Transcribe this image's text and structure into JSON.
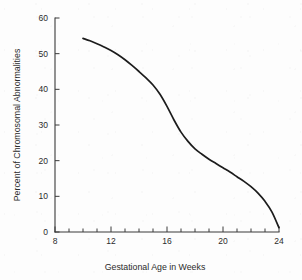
{
  "chart_data": {
    "type": "line",
    "title": "",
    "xlabel": "Gestational Age in Weeks",
    "ylabel": "Percent of Chromosomal Abnormalities",
    "xlim": [
      8,
      24
    ],
    "ylim": [
      0,
      60
    ],
    "grid": false,
    "legend": "none",
    "x_tick_labels": [
      "8",
      "12",
      "16",
      "20",
      "24"
    ],
    "x_major_ticks": [
      8,
      12,
      16,
      20,
      24
    ],
    "x_minor_ticks": [
      9,
      10,
      11,
      13,
      14,
      15,
      17,
      18,
      19,
      21,
      22,
      23
    ],
    "y_tick_labels": [
      "0",
      "10",
      "20",
      "30",
      "40",
      "50",
      "60"
    ],
    "y_major_ticks": [
      0,
      10,
      20,
      30,
      40,
      50,
      60
    ],
    "series": [
      {
        "name": "Percent of Chromosomal Abnormalities",
        "color": "#1c1c1c",
        "x": [
          10.0,
          10.5,
          11.0,
          11.5,
          12.0,
          12.5,
          13.0,
          13.5,
          14.0,
          14.5,
          15.0,
          15.5,
          16.0,
          16.5,
          17.0,
          17.5,
          18.0,
          18.5,
          19.0,
          19.5,
          20.0,
          20.5,
          21.0,
          21.5,
          22.0,
          22.5,
          23.0,
          23.5,
          24.0
        ],
        "y": [
          54.3,
          53.6,
          52.8,
          51.9,
          50.9,
          49.7,
          48.3,
          46.7,
          45.0,
          43.2,
          41.2,
          38.6,
          35.2,
          31.4,
          28.0,
          25.4,
          23.3,
          21.8,
          20.4,
          19.2,
          18.0,
          16.8,
          15.5,
          14.2,
          12.7,
          10.9,
          8.6,
          5.6,
          1.2
        ]
      }
    ]
  },
  "axis": {
    "y_label": "Percent of Chromosomal Abnormalities",
    "x_label": "Gestational Age in Weeks"
  },
  "colors": {
    "curve": "#1c1c1c",
    "axis": "#3a3a3a",
    "text": "#2b2b2b",
    "background": "#fdfdfd"
  }
}
